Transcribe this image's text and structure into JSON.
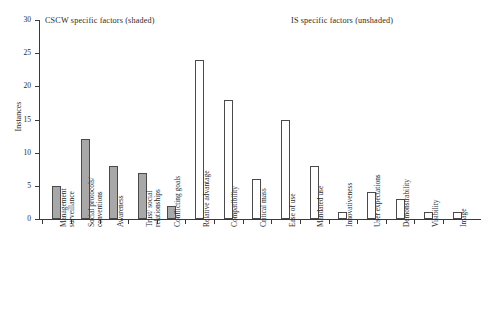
{
  "chart_data": {
    "type": "bar",
    "title": "",
    "xlabel": "",
    "ylabel": "Instances",
    "ylim": [
      0,
      30
    ],
    "yticks": [
      0,
      5,
      10,
      15,
      20,
      25,
      30
    ],
    "grid": false,
    "legend_position": "none",
    "annotations": [
      "CSCW specific factors (shaded)",
      "IS specific factors (unshaded)"
    ],
    "categories": [
      "Management surveillance",
      "Social protocols/ conventions",
      "Awareness",
      "Trust/ social relationships",
      "Conflicting goals",
      "Relative advantage",
      "Compatibility",
      "Critical mass",
      "Ease of use",
      "Mandated use",
      "Innovativeness",
      "User expectations",
      "Demonstrability",
      "Visibility",
      "Image"
    ],
    "values": [
      5,
      12,
      8,
      7,
      2,
      24,
      18,
      6,
      15,
      8,
      1,
      4,
      3,
      1,
      1
    ],
    "bar_styles": [
      "shaded",
      "shaded",
      "shaded",
      "shaded",
      "shaded",
      "unshaded",
      "unshaded",
      "unshaded",
      "unshaded",
      "unshaded",
      "unshaded",
      "unshaded",
      "unshaded",
      "unshaded",
      "unshaded"
    ],
    "colors": {
      "shaded_fill": "#a8a8a8",
      "unshaded_fill": "#ffffff",
      "bar_border": "#4a4a4a",
      "axis": "#3a3a3a",
      "text": "#2b2b2b"
    }
  },
  "axes": {
    "y": {
      "title": "Instances",
      "ticks": [
        {
          "label": "30"
        },
        {
          "label": "25"
        },
        {
          "label": "20"
        },
        {
          "label": "15"
        },
        {
          "label": "10"
        },
        {
          "label": "5"
        },
        {
          "label": "0"
        }
      ]
    }
  },
  "annotations": {
    "cscw": "CSCW specific factors (shaded)",
    "is": "IS specific factors (unshaded)"
  },
  "category_labels": [
    {
      "line1": "Management",
      "line2": "surveillance",
      "text": "Management\nsurveillance"
    },
    {
      "line1": "Social protocols/",
      "line2": "conventions",
      "text": "Social protocols/\nconventions"
    },
    {
      "line1": "Awareness",
      "line2": "",
      "text": "Awareness"
    },
    {
      "line1": "Trust/ social",
      "line2": "relationships",
      "text": "Trust/ social\nrelationships"
    },
    {
      "line1": "Conflicting goals",
      "line2": "",
      "text": "Conflicting goals"
    },
    {
      "line1": "Relative advantage",
      "line2": "",
      "text": "Relative advantage"
    },
    {
      "line1": "Compatibility",
      "line2": "",
      "text": "Compatibility"
    },
    {
      "line1": "Critical mass",
      "line2": "",
      "text": "Critical mass"
    },
    {
      "line1": "Ease of use",
      "line2": "",
      "text": "Ease of use"
    },
    {
      "line1": "Mandated use",
      "line2": "",
      "text": "Mandated use"
    },
    {
      "line1": "Innovativeness",
      "line2": "",
      "text": "Innovativeness"
    },
    {
      "line1": "User expectations",
      "line2": "",
      "text": "User expectations"
    },
    {
      "line1": "Demonstrability",
      "line2": "",
      "text": "Demonstrability"
    },
    {
      "line1": "Visibility",
      "line2": "",
      "text": "Visibility"
    },
    {
      "line1": "Image",
      "line2": "",
      "text": "Image"
    }
  ]
}
